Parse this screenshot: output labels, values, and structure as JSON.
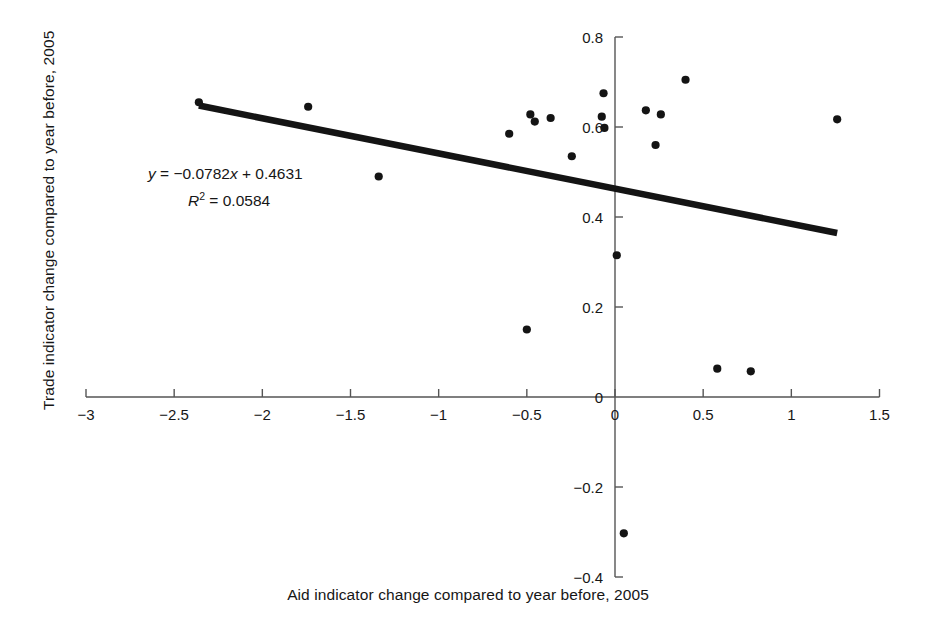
{
  "chart_data": {
    "type": "scatter",
    "title": "",
    "xlabel": "Aid indicator change compared to year before, 2005",
    "ylabel": "Trade indicator change compared to year before, 2005",
    "xlim": [
      -3,
      1.5
    ],
    "ylim": [
      -0.4,
      0.8
    ],
    "xticks": [
      -3,
      -2.5,
      -2,
      -1.5,
      -1,
      -0.5,
      0,
      0.5,
      1,
      1.5
    ],
    "xtick_labels": [
      "−3",
      "−2.5",
      "−2",
      "−1.5",
      "−1",
      "−0.5",
      "0",
      "0.5",
      "1",
      "1.5"
    ],
    "yticks": [
      -0.4,
      -0.2,
      0,
      0.2,
      0.4,
      0.6,
      0.8
    ],
    "ytick_labels": [
      "−0.4",
      "−0.2",
      "0",
      "0.2",
      "0.4",
      "0.6",
      "0.8"
    ],
    "grid": false,
    "legend": null,
    "marker": {
      "shape": "circle",
      "color": "#141414",
      "size": 7
    },
    "points": [
      {
        "x": -2.36,
        "y": 0.655
      },
      {
        "x": -1.74,
        "y": 0.645
      },
      {
        "x": -1.34,
        "y": 0.49
      },
      {
        "x": -0.6,
        "y": 0.585
      },
      {
        "x": -0.48,
        "y": 0.628
      },
      {
        "x": -0.455,
        "y": 0.612
      },
      {
        "x": -0.365,
        "y": 0.62
      },
      {
        "x": -0.245,
        "y": 0.535
      },
      {
        "x": -0.5,
        "y": 0.15
      },
      {
        "x": -0.075,
        "y": 0.623
      },
      {
        "x": -0.06,
        "y": 0.598
      },
      {
        "x": -0.065,
        "y": 0.675
      },
      {
        "x": 0.01,
        "y": 0.315
      },
      {
        "x": 0.05,
        "y": -0.303
      },
      {
        "x": 0.175,
        "y": 0.637
      },
      {
        "x": 0.23,
        "y": 0.56
      },
      {
        "x": 0.26,
        "y": 0.628
      },
      {
        "x": 0.4,
        "y": 0.705
      },
      {
        "x": 0.58,
        "y": 0.063
      },
      {
        "x": 0.77,
        "y": 0.057
      },
      {
        "x": 1.26,
        "y": 0.617
      }
    ],
    "trendline": {
      "equation_label": "y = −0.0782x + 0.4631",
      "r2_label": "R² = 0.0584",
      "slope": -0.0782,
      "intercept": 0.4631,
      "r_squared": 0.0584,
      "x_start": -2.36,
      "x_end": 1.26,
      "color": "#141414"
    },
    "equation_parts": {
      "y_var": "y",
      "eq_rest": " = −0.0782",
      "x_var": "x",
      "eq_tail": " + 0.4631",
      "r_var": "R",
      "r_sup": "2",
      "r_rest": " = 0.0584"
    }
  },
  "axis": {
    "line_color": "#555555",
    "tick_color": "#555555"
  }
}
